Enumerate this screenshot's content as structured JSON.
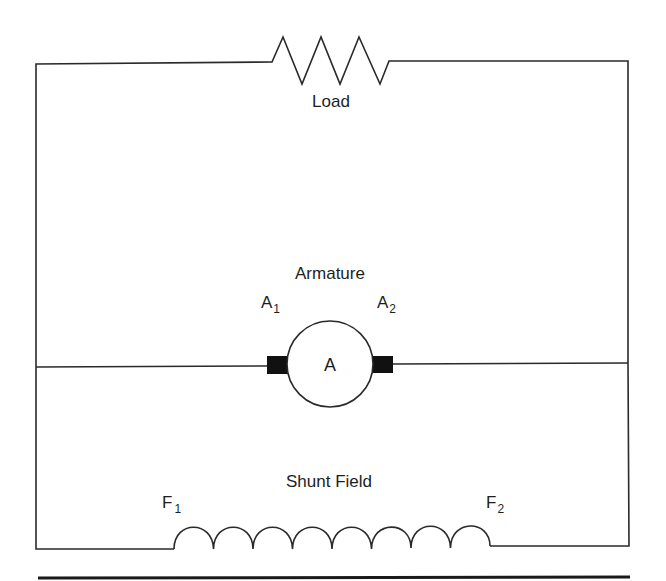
{
  "diagram": {
    "type": "dc-shunt-motor-circuit",
    "labels": {
      "load": "Load",
      "armature": "Armature",
      "armature_symbol": "A",
      "a1_main": "A",
      "a1_sub": "1",
      "a2_main": "A",
      "a2_sub": "2",
      "shunt_field": "Shunt Field",
      "f1_main": "F",
      "f1_sub": "1",
      "f2_main": "F",
      "f2_sub": "2"
    },
    "components": [
      {
        "name": "Load",
        "symbol": "resistor-zigzag",
        "peaks": 3
      },
      {
        "name": "Armature",
        "symbol": "circle-with-brushes",
        "terminals": [
          "A1",
          "A2"
        ]
      },
      {
        "name": "Shunt Field",
        "symbol": "coil",
        "turns": 8,
        "terminals": [
          "F1",
          "F2"
        ]
      }
    ],
    "colors": {
      "line": "#2a2a2a",
      "text": "#1e1e1e",
      "brush": "#111111",
      "background": "#ffffff"
    }
  }
}
